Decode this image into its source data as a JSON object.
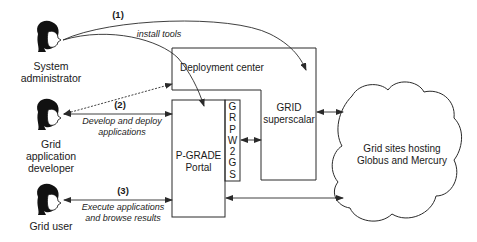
{
  "actors": [
    {
      "id": "sysadmin",
      "label_lines": [
        "System",
        "administrator"
      ],
      "icon": "person-head-icon"
    },
    {
      "id": "developer",
      "label_lines": [
        "Grid",
        "application",
        "developer"
      ],
      "icon": "person-head-icon"
    },
    {
      "id": "user",
      "label_lines": [
        "Grid user"
      ],
      "icon": "person-head-icon"
    }
  ],
  "flows": [
    {
      "step": "(1)",
      "description_lines": [
        "install tools"
      ]
    },
    {
      "step": "(2)",
      "description_lines": [
        "Develop and deploy",
        "applications"
      ]
    },
    {
      "step": "(3)",
      "description_lines": [
        "Execute applications",
        "and browse results"
      ]
    }
  ],
  "components": {
    "deployment_center": "Deployment center",
    "grid_superscalar": [
      "GRID",
      "superscalar"
    ],
    "pgrade_portal": [
      "P-GRADE",
      "Portal"
    ],
    "grpw2gs": [
      "G",
      "R",
      "P",
      "W",
      "2",
      "G",
      "S"
    ],
    "grid_sites": [
      "Grid sites hosting",
      "Globus and Mercury"
    ]
  },
  "colors": {
    "line": "#2a2a2a",
    "background": "#ffffff"
  }
}
